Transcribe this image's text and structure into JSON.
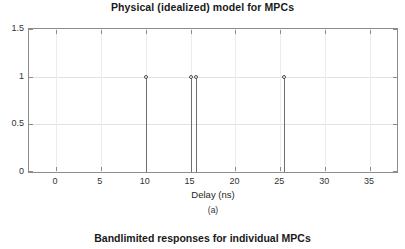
{
  "figure_a": {
    "title": "Physical (idealized) model for MPCs",
    "xlabel": "Delay (ns)",
    "ylabel": "",
    "subcaption": "(a)"
  },
  "figure_b": {
    "title": "Bandlimited responses for individual MPCs"
  },
  "chart_data": {
    "type": "stem",
    "title": "Physical (idealized) model for MPCs",
    "xlabel": "Delay (ns)",
    "ylabel": "",
    "xlim": [
      -3.0,
      38.0
    ],
    "ylim": [
      0,
      1.5
    ],
    "xticks": [
      0,
      5,
      10,
      15,
      20,
      25,
      30,
      35
    ],
    "xticklabels": [
      "0",
      "5",
      "10",
      "15",
      "20",
      "25",
      "30",
      "35"
    ],
    "yticks": [
      0,
      0.5,
      1,
      1.5
    ],
    "yticklabels": [
      "0",
      "0.5",
      "1",
      "1.5"
    ],
    "grid": true,
    "legend": null,
    "series": [
      {
        "name": "MPC amplitudes",
        "x": [
          10.0,
          15.0,
          15.6,
          25.4
        ],
        "values": [
          1.0,
          1.0,
          1.0,
          1.0
        ],
        "marker": "circle",
        "color": "#6e6e6e"
      }
    ]
  }
}
